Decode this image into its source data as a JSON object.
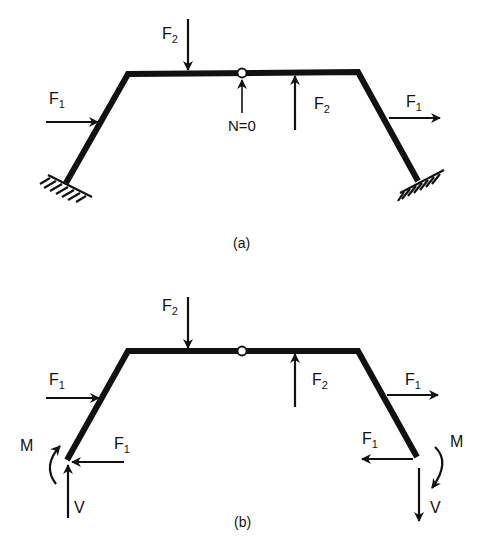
{
  "figure": {
    "panels": [
      {
        "id": "a",
        "caption": "(a)",
        "description": "Symmetric trapezoidal frame with fixed supports and central hinge; antisymmetric loading",
        "labels": {
          "f2_top": {
            "main": "F",
            "sub": "2"
          },
          "f1_left": {
            "main": "F",
            "sub": "1"
          },
          "n_hinge": "N=0",
          "f2_right": {
            "main": "F",
            "sub": "2"
          },
          "f1_right": {
            "main": "F",
            "sub": "1"
          }
        }
      },
      {
        "id": "b",
        "caption": "(b)",
        "description": "Free body with supports replaced by reactions",
        "labels": {
          "f2_top": {
            "main": "F",
            "sub": "2"
          },
          "f1_left": {
            "main": "F",
            "sub": "1"
          },
          "m_left": "M",
          "f1_left_reaction": {
            "main": "F",
            "sub": "1"
          },
          "v_left": "V",
          "f2_right": {
            "main": "F",
            "sub": "2"
          },
          "f1_right": {
            "main": "F",
            "sub": "1"
          },
          "f1_right_reaction": {
            "main": "F",
            "sub": "1"
          },
          "m_right": "M",
          "v_right": "V"
        }
      }
    ],
    "colors": {
      "ink": "#111111",
      "background": "#ffffff"
    }
  }
}
